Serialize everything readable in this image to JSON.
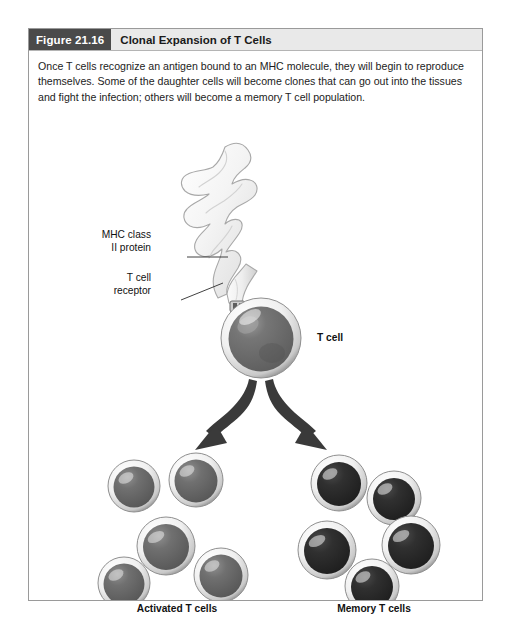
{
  "figure": {
    "number_label": "Figure 21.16",
    "title": "Clonal Expansion of T Cells",
    "caption": "Once T cells recognize an antigen bound to an MHC molecule, they will begin to reproduce themselves. Some of the daughter cells will become clones that can go out into the tissues and fight the infection; others will become a memory T cell population."
  },
  "labels": {
    "mhc_line1": "MHC class",
    "mhc_line2": "II protein",
    "receptor_line1": "T cell",
    "receptor_line2": "receptor",
    "t_cell": "T cell",
    "activated": "Activated T cells",
    "memory": "Memory T cells"
  },
  "colors": {
    "header_bar": "#e9e9e9",
    "figure_number_bg": "#4a4a4a",
    "border": "#9a9a9a",
    "text": "#1c1c1c",
    "cell_rim_light": "#fdfdfd",
    "cell_rim_shadow": "#8f8f8f",
    "nucleus_activated": "#6a6a6a",
    "nucleus_memory": "#2e2e2e",
    "apc_body": "#f2f2f2",
    "apc_outline": "#a8a8a8",
    "arrow": "#3a3a3a"
  },
  "diagram": {
    "type": "biological-process",
    "apc_name": "antigen-presenting-cell",
    "activated_cell_count": 5,
    "memory_cell_count": 5,
    "branch_count": 2
  }
}
